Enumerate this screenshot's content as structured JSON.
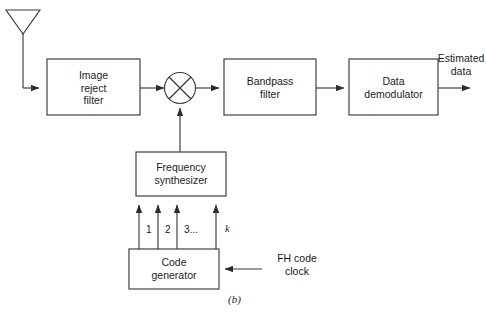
{
  "figure": {
    "caption": "(b)",
    "background_color": "#ffffff",
    "line_color": "#3a3a3a",
    "text_color": "#1b1b1b"
  },
  "blocks": [
    {
      "id": "image-reject-filter",
      "label": "Image\nreject\nfilter"
    },
    {
      "id": "bandpass-filter",
      "label": "Bandpass\nfilter"
    },
    {
      "id": "data-demodulator",
      "label": "Data\ndemodulator"
    },
    {
      "id": "frequency-synthesizer",
      "label": "Frequency\nsynthesizer"
    },
    {
      "id": "code-generator",
      "label": "Code\ngenerator"
    }
  ],
  "symbols": {
    "antenna": "antenna-symbol",
    "mixer": "mixer-circle-x"
  },
  "labels": {
    "estimated_data": "Estimated\ndata",
    "fh_code_clock": "FH code\nclock"
  },
  "tap_lines": [
    {
      "index": 1,
      "label": "1"
    },
    {
      "index": 2,
      "label": "2"
    },
    {
      "index": 3,
      "label": "3..."
    },
    {
      "index": 4,
      "label": "k"
    }
  ]
}
